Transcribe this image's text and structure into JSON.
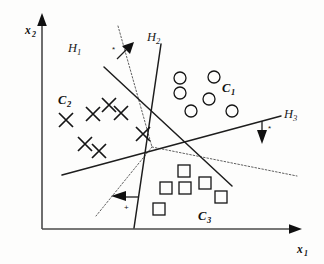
{
  "figure": {
    "background_color": "#fdfdfc",
    "ink_color": "#151515"
  },
  "axes": {
    "x": {
      "label": "x",
      "subscript": "1",
      "name": "x-axis"
    },
    "y": {
      "label": "x",
      "subscript": "2",
      "name": "y-axis"
    }
  },
  "hyperplanes": [
    {
      "id": "H1",
      "label": "H",
      "subscript": "1",
      "label_x": 72,
      "label_y": 48,
      "x1": 104,
      "y1": 67,
      "x2": 232,
      "y2": 186,
      "sign_glyph": "*",
      "sign_x": 113,
      "sign_y": 52,
      "tick_x1": 117,
      "tick_y1": 59,
      "tick_x2": 124,
      "tick_y2": 52,
      "arrow_x": 133,
      "arrow_y": 44,
      "arrow_angle": -43
    },
    {
      "id": "H2",
      "label": "H",
      "subscript": "2",
      "label_x": 150,
      "label_y": 38,
      "x1": 161,
      "y1": 44,
      "x2": 134,
      "y2": 228,
      "sign_glyph": "+",
      "sign_x": 127,
      "sign_y": 209,
      "tick_x1": 131,
      "tick_y1": 197,
      "tick_x2": 121,
      "tick_y2": 197,
      "arrow_x": 112,
      "arrow_y": 196,
      "arrow_angle": 180
    },
    {
      "id": "H3",
      "label": "H",
      "subscript": "3",
      "label_x": 288,
      "label_y": 115,
      "x1": 62,
      "y1": 175,
      "x2": 281,
      "y2": 116,
      "sign_glyph": "*",
      "sign_x": 275,
      "sign_y": 131,
      "tick_x1": 264,
      "tick_y1": 124,
      "tick_x2": 264,
      "tick_y2": 133,
      "arrow_x": 264,
      "arrow_y": 142,
      "arrow_angle": 90
    }
  ],
  "decision_boundaries": [
    {
      "name": "upper-left-ray",
      "x1": 118,
      "y1": 26,
      "x2": 152,
      "y2": 147
    },
    {
      "name": "lower-left-ray",
      "x1": 152,
      "y1": 147,
      "x2": 96,
      "y2": 216
    },
    {
      "name": "right-ray",
      "x1": 152,
      "y1": 147,
      "x2": 297,
      "y2": 176
    }
  ],
  "clusters": [
    {
      "id": "C1",
      "label": "C",
      "subscript": "1",
      "marker": "circle",
      "label_x": 226,
      "label_y": 89,
      "points": [
        {
          "x": 180,
          "y": 78
        },
        {
          "x": 214,
          "y": 77
        },
        {
          "x": 180,
          "y": 93
        },
        {
          "x": 209,
          "y": 99
        },
        {
          "x": 191,
          "y": 111
        },
        {
          "x": 232,
          "y": 111
        }
      ]
    },
    {
      "id": "C2",
      "label": "C",
      "subscript": "2",
      "marker": "cross",
      "label_x": 62,
      "label_y": 101,
      "points": [
        {
          "x": 66,
          "y": 120
        },
        {
          "x": 93,
          "y": 114
        },
        {
          "x": 109,
          "y": 105
        },
        {
          "x": 121,
          "y": 113
        },
        {
          "x": 85,
          "y": 144
        },
        {
          "x": 99,
          "y": 151
        },
        {
          "x": 143,
          "y": 134
        }
      ]
    },
    {
      "id": "C3",
      "label": "C",
      "subscript": "3",
      "marker": "square",
      "label_x": 201,
      "label_y": 217,
      "points": [
        {
          "x": 184,
          "y": 171
        },
        {
          "x": 166,
          "y": 188
        },
        {
          "x": 185,
          "y": 188
        },
        {
          "x": 205,
          "y": 183
        },
        {
          "x": 221,
          "y": 197
        },
        {
          "x": 159,
          "y": 209
        }
      ]
    }
  ],
  "marker_sizes": {
    "circle_radius": 6,
    "cross_half": 7,
    "square_half": 6
  }
}
